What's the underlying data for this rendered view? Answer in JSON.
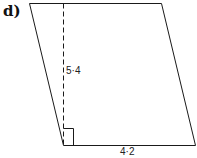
{
  "part_label": "d)",
  "shape": "parallelogram",
  "height_label": "5·4",
  "base_label": "4·2",
  "colors": {
    "line": "#1a1a1a",
    "background": "#ffffff"
  }
}
